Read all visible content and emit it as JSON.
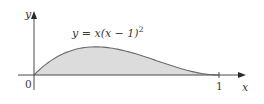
{
  "chart_data": {
    "type": "area",
    "title": "",
    "function_label": "y = x(x − 1)²",
    "function_parts": {
      "lhs": "y = x(x − 1)",
      "exp": "2"
    },
    "xlabel": "x",
    "ylabel": "y",
    "origin_label": "0",
    "x_ticks": [
      {
        "value": 1,
        "label": "1"
      }
    ],
    "xlim": [
      0,
      1.15
    ],
    "ylim": [
      0,
      0.3
    ],
    "grid": false,
    "legend": "none",
    "shaded_region": {
      "from": 0,
      "to": 1,
      "fill": "#dcdcdc",
      "description": "area between curve and x-axis"
    },
    "series": [
      {
        "name": "y = x(x − 1)²",
        "x": [
          0,
          0.1,
          0.2,
          0.3333,
          0.4,
          0.5,
          0.6,
          0.7,
          0.8,
          0.9,
          1.0
        ],
        "y": [
          0,
          0.081,
          0.128,
          0.148,
          0.144,
          0.125,
          0.096,
          0.063,
          0.032,
          0.009,
          0
        ]
      }
    ]
  },
  "colors": {
    "axis": "#4a4a4a",
    "curve": "#6a6a6a",
    "fill": "#dcdcdc",
    "text": "#3a3a3a"
  }
}
